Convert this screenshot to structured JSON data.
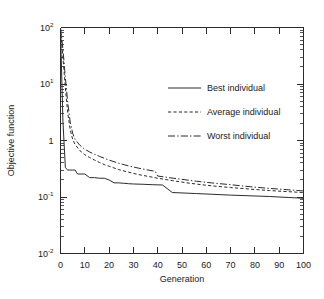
{
  "chart_data": {
    "type": "line",
    "title": "",
    "xlabel": "Generation",
    "ylabel": "Objective function",
    "xlim": [
      0,
      100
    ],
    "ylim": [
      0.01,
      100
    ],
    "yscale": "log",
    "xscale": "linear",
    "grid": false,
    "legend_position": "upper right",
    "xticks": [
      0,
      10,
      20,
      30,
      40,
      50,
      60,
      70,
      80,
      90,
      100
    ],
    "xticklabels": [
      "0",
      "10",
      "20",
      "30",
      "40",
      "50",
      "60",
      "70",
      "80",
      "90",
      "100"
    ],
    "yticks": [
      0.01,
      0.1,
      1,
      10,
      100
    ],
    "yticklabels": [
      "10-2",
      "10-1",
      "1",
      "101",
      "102"
    ],
    "ytick_mantissa": [
      "10",
      "10",
      "1",
      "10",
      "10"
    ],
    "ytick_exponent": [
      "-2",
      "-1",
      "",
      "1",
      "2"
    ],
    "series": [
      {
        "name": "Best individual",
        "style": "solid",
        "x": [
          0,
          1,
          2,
          3,
          4,
          5,
          6,
          7,
          8,
          10,
          12,
          14,
          16,
          18,
          20,
          22,
          24,
          26,
          28,
          30,
          34,
          38,
          42,
          46,
          50,
          56,
          62,
          70,
          78,
          86,
          94,
          100
        ],
        "y": [
          90,
          2.2,
          0.33,
          0.3,
          0.3,
          0.3,
          0.3,
          0.255,
          0.255,
          0.255,
          0.22,
          0.22,
          0.215,
          0.215,
          0.2,
          0.178,
          0.178,
          0.175,
          0.172,
          0.17,
          0.168,
          0.165,
          0.163,
          0.12,
          0.118,
          0.115,
          0.112,
          0.108,
          0.105,
          0.102,
          0.098,
          0.095
        ]
      },
      {
        "name": "Average individual",
        "style": "dashed",
        "x": [
          0,
          1,
          2,
          3,
          4,
          5,
          6,
          8,
          10,
          12,
          14,
          16,
          18,
          20,
          24,
          28,
          32,
          36,
          40,
          46,
          52,
          58,
          64,
          70,
          78,
          86,
          94,
          100
        ],
        "y": [
          95,
          30,
          8.5,
          3.0,
          1.55,
          1.05,
          0.85,
          0.66,
          0.56,
          0.5,
          0.45,
          0.41,
          0.375,
          0.35,
          0.305,
          0.275,
          0.25,
          0.232,
          0.215,
          0.195,
          0.178,
          0.165,
          0.155,
          0.147,
          0.138,
          0.13,
          0.124,
          0.12
        ]
      },
      {
        "name": "Worst individual",
        "style": "dashdot",
        "x": [
          0,
          1,
          2,
          3,
          4,
          5,
          6,
          8,
          10,
          12,
          14,
          16,
          18,
          20,
          24,
          28,
          32,
          36,
          39,
          40,
          44,
          50,
          56,
          62,
          70,
          78,
          86,
          94,
          100
        ],
        "y": [
          98,
          42,
          13,
          4.6,
          2.1,
          1.35,
          1.05,
          0.82,
          0.7,
          0.625,
          0.57,
          0.525,
          0.485,
          0.45,
          0.395,
          0.355,
          0.325,
          0.3,
          0.285,
          0.235,
          0.222,
          0.205,
          0.19,
          0.178,
          0.165,
          0.152,
          0.142,
          0.134,
          0.128
        ]
      }
    ],
    "colors": {
      "axis": "#2b2b2b",
      "line": "#2b2b2b",
      "background": "#ffffff"
    }
  },
  "legend": {
    "items": [
      {
        "label": "Best individual",
        "style": "solid"
      },
      {
        "label": "Average individual",
        "style": "dashed"
      },
      {
        "label": "Worst individual",
        "style": "dashdot"
      }
    ]
  }
}
